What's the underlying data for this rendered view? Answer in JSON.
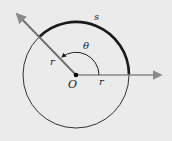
{
  "diagram": {
    "type": "angle-arc-length",
    "labels": {
      "arc": "s",
      "angle": "θ",
      "radius_diagonal": "r",
      "radius_horizontal": "r",
      "origin": "O"
    },
    "colors": {
      "background": "#ebebeb",
      "circle": "#333333",
      "arc_s": "#1a1a1a",
      "ray": "#8a8a8a",
      "angle_arc": "#222222",
      "origin_dot": "#000000"
    }
  }
}
